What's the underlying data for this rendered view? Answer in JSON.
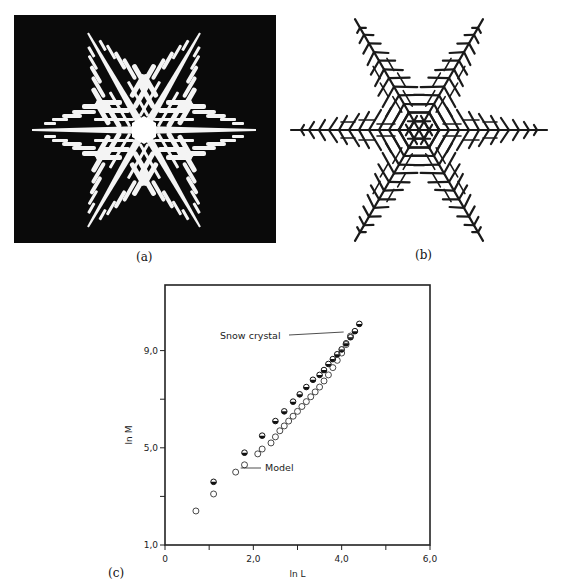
{
  "figure": {
    "panels": [
      {
        "id": "a",
        "label": "(a)",
        "description": "Photograph of a real snow crystal, white dendrite on black background"
      },
      {
        "id": "b",
        "label": "(b)",
        "description": "Simulated hexagonal dendritic growth pattern (model)"
      },
      {
        "id": "c",
        "label": "(c)",
        "description": "Log-log plot of mass vs. size"
      }
    ]
  },
  "chart_data": {
    "type": "scatter",
    "title": "",
    "xlabel": "ln L",
    "ylabel": "ln M",
    "xlim": [
      0,
      6.0
    ],
    "ylim": [
      1.0,
      11.7
    ],
    "xticks": [
      0,
      1.0,
      2.0,
      3.0,
      4.0,
      5.0,
      6.0
    ],
    "xtick_labels": [
      "0",
      "",
      "2,0",
      "",
      "4,0",
      "",
      "6,0"
    ],
    "yticks": [
      1.0,
      3.0,
      5.0,
      7.0,
      9.0
    ],
    "ytick_labels": [
      "1,0",
      "",
      "5,0",
      "",
      "9,0"
    ],
    "grid": false,
    "legend": "annotations",
    "annotations": [
      {
        "text": "Snow crystal",
        "points_to": [
          4.0,
          9.6
        ]
      },
      {
        "text": "Model",
        "points_to": [
          1.6,
          4.0
        ]
      }
    ],
    "series": [
      {
        "name": "Snow crystal",
        "marker": "half-filled circle",
        "x": [
          1.1,
          1.8,
          2.2,
          2.5,
          2.7,
          2.9,
          3.05,
          3.2,
          3.35,
          3.5,
          3.6,
          3.7,
          3.8,
          3.9,
          4.0,
          4.1,
          4.2,
          4.3,
          4.4
        ],
        "y": [
          3.6,
          4.8,
          5.5,
          6.1,
          6.5,
          6.9,
          7.2,
          7.5,
          7.8,
          8.0,
          8.2,
          8.45,
          8.65,
          8.85,
          9.05,
          9.3,
          9.55,
          9.8,
          10.1
        ]
      },
      {
        "name": "Model",
        "marker": "open circle",
        "x": [
          0.7,
          1.1,
          1.6,
          1.8,
          2.1,
          2.2,
          2.4,
          2.5,
          2.6,
          2.7,
          2.8,
          2.9,
          3.0,
          3.1,
          3.2,
          3.3,
          3.4,
          3.5,
          3.6,
          3.7,
          3.8,
          3.9,
          4.0,
          4.1,
          4.2
        ],
        "y": [
          2.4,
          3.1,
          4.0,
          4.3,
          4.75,
          4.95,
          5.2,
          5.45,
          5.7,
          5.9,
          6.1,
          6.3,
          6.5,
          6.7,
          6.9,
          7.1,
          7.3,
          7.5,
          7.75,
          8.0,
          8.3,
          8.6,
          8.9,
          9.25,
          9.6
        ]
      }
    ]
  }
}
